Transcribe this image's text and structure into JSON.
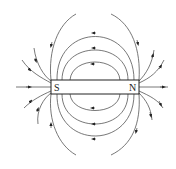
{
  "diagram": {
    "magnet": {
      "left_pole_label": "S",
      "right_pole_label": "N"
    },
    "colors": {
      "line": "#555555",
      "arrow": "#222222",
      "background": "#ffffff"
    }
  }
}
